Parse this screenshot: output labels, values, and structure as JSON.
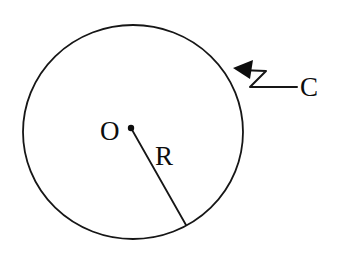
{
  "figure": {
    "background_color": "#ffffff",
    "ink_color": "#141414",
    "canvas": {
      "width": 337,
      "height": 255
    },
    "labels": {
      "center_label": "O",
      "radius_label": "R",
      "circumference_label": "C"
    },
    "shapes": {
      "circle": {
        "name": "circle-outline",
        "center_x": 133,
        "center_y": 132,
        "radius_x": 110,
        "radius_y": 107,
        "stroke_width": 1.8
      },
      "center_dot": {
        "name": "center-point",
        "cx": 131,
        "cy": 128,
        "r": 3.2
      },
      "radius_line": {
        "name": "radius-segment",
        "x1": 131,
        "y1": 128,
        "x2": 186,
        "y2": 225,
        "stroke_width": 1.8
      },
      "leader": {
        "name": "zigzag-leader-line",
        "path": "M 297 87 L 250 87 L 266 71 L 240 70",
        "stroke_width": 2.0
      },
      "arrowhead": {
        "name": "leader-arrowhead",
        "points": "233,68 252,61 249,78",
        "angle_deg": -8
      }
    },
    "label_positions": {
      "center_label": {
        "x": 100,
        "y": 140
      },
      "radius_label": {
        "x": 155,
        "y": 165
      },
      "circumference_label": {
        "x": 300,
        "y": 96
      }
    }
  }
}
